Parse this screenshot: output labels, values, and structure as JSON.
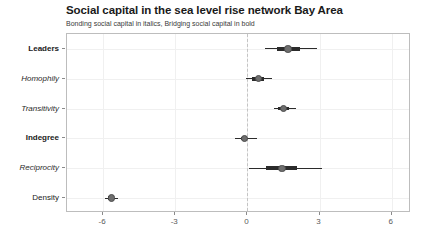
{
  "chart_data": {
    "type": "scatter",
    "title": "Social capital in the sea level rise network Bay Area",
    "subtitle": "Bonding social capital in italics, Bridging social capital in bold",
    "xlabel": "",
    "ylabel": "",
    "xlim": [
      -7.5,
      6.8
    ],
    "xticks": [
      -6,
      -3,
      0,
      3,
      6
    ],
    "xtick_labels": [
      "-6",
      "-3",
      "0",
      "3",
      "6"
    ],
    "grid": true,
    "legend": "none",
    "reference_line": 0,
    "categories": [
      "Leaders",
      "Homophily",
      "Transitivity",
      "Indegree",
      "Reciprocity",
      "Density"
    ],
    "label_styles": [
      "bold",
      "italic",
      "italic",
      "bold",
      "italic",
      "normal"
    ],
    "values": [
      1.69,
      0.45,
      1.49,
      -0.13,
      1.43,
      -5.66
    ],
    "ci_inner": [
      [
        1.22,
        2.18
      ],
      [
        0.2,
        0.7
      ],
      [
        1.29,
        1.72
      ],
      [
        -0.27,
        0.0
      ],
      [
        0.79,
        2.07
      ],
      [
        -5.78,
        -5.55
      ]
    ],
    "ci_outer": [
      [
        0.73,
        2.9
      ],
      [
        -0.04,
        1.03
      ],
      [
        1.1,
        2.0
      ],
      [
        -0.5,
        0.38
      ],
      [
        0.08,
        3.1
      ],
      [
        -5.9,
        -5.36
      ]
    ],
    "point_color": "#6e6e6e",
    "line_color": "#2b2b2b",
    "grid_color": "#f0f0f0",
    "panel_border_color": "#bdbdbd"
  }
}
